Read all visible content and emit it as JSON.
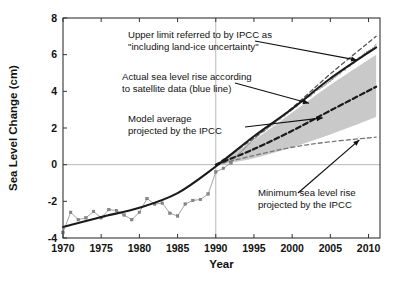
{
  "chart_data": {
    "type": "line",
    "title": "",
    "xlabel": "Year",
    "ylabel": "Sea Level Change (cm)",
    "xlim": [
      1970,
      2011.5
    ],
    "ylim": [
      -4,
      8
    ],
    "xticks": [
      1970,
      1975,
      1980,
      1985,
      1990,
      1995,
      2000,
      2005,
      2010
    ],
    "yticks": [
      -4,
      -2,
      0,
      2,
      4,
      6,
      8
    ],
    "xtick_labels": [
      "1970",
      "1975",
      "1980",
      "1985",
      "1990",
      "1995",
      "2000",
      "2005",
      "2010"
    ],
    "ytick_labels": [
      "-4",
      "-2",
      "0",
      "2",
      "4",
      "6",
      "8"
    ],
    "grid": false,
    "legend_position": "none",
    "reference_lines": [
      {
        "name": "zero-level-line",
        "axis": "y",
        "value": 0
      },
      {
        "name": "baseline-year-line",
        "axis": "x",
        "value": 1990
      }
    ],
    "series": [
      {
        "name": "Tide gauge observations",
        "style": "markers-thin-line",
        "color": "#8c8c8c",
        "x": [
          1970,
          1971,
          1972,
          1973,
          1974,
          1975,
          1976,
          1977,
          1978,
          1979,
          1980,
          1981,
          1982,
          1983,
          1984,
          1985,
          1986,
          1987,
          1988,
          1989,
          1990,
          1991,
          1992
        ],
        "values": [
          -3.7,
          -2.6,
          -3.0,
          -2.9,
          -2.55,
          -2.9,
          -2.45,
          -2.5,
          -2.75,
          -3.0,
          -2.6,
          -1.85,
          -2.15,
          -2.1,
          -2.65,
          -2.8,
          -2.15,
          -1.95,
          -1.9,
          -1.6,
          -0.4,
          -0.2,
          0.1
        ]
      },
      {
        "name": "Tide gauge smoothed trend",
        "style": "solid-thick",
        "color": "#1a1a1a",
        "x": [
          1970,
          1975,
          1980,
          1985,
          1990,
          1995,
          2000,
          2005,
          2011
        ],
        "values": [
          -3.4,
          -2.85,
          -2.35,
          -1.55,
          -0.1,
          1.55,
          3.05,
          4.7,
          6.4
        ]
      },
      {
        "name": "Actual sea level rise according to satellite data (blue line)",
        "style": "noisy-line",
        "color": "#7a7a7a",
        "x": [
          1992,
          1995,
          2000,
          2005,
          2011
        ],
        "values": [
          0.15,
          1.4,
          3.0,
          4.6,
          6.5
        ]
      },
      {
        "name": "Upper limit referred to by IPCC as \"including land-ice uncertainty\"",
        "style": "dashed",
        "color": "#555555",
        "x": [
          1990,
          1995,
          2000,
          2005,
          2011
        ],
        "values": [
          0,
          1.45,
          3.1,
          4.95,
          7.0
        ]
      },
      {
        "name": "Model average projected by the IPCC",
        "style": "dashed-thick",
        "color": "#1a1a1a",
        "x": [
          1990,
          1995,
          2000,
          2005,
          2011
        ],
        "values": [
          0,
          0.85,
          1.85,
          2.95,
          4.25
        ]
      },
      {
        "name": "Minimum sea level rise projected by the IPCC",
        "style": "dashed",
        "color": "#777777",
        "x": [
          1990,
          1995,
          2000,
          2005,
          2011
        ],
        "values": [
          0,
          0.5,
          0.95,
          1.25,
          1.5
        ]
      },
      {
        "name": "IPCC projection uncertainty band",
        "style": "shaded-band",
        "color": "#c9c9c9",
        "x": [
          1990,
          1995,
          2000,
          2005,
          2011
        ],
        "upper": [
          0.05,
          1.35,
          2.85,
          4.35,
          6.0
        ],
        "lower": [
          -0.05,
          0.35,
          0.95,
          1.65,
          2.6
        ]
      }
    ],
    "annotations": [
      {
        "name": "upper-limit-annotation",
        "lines": [
          "Upper limit referred to by IPCC as",
          "\"including land-ice uncertainty\""
        ],
        "arrow_to": {
          "x": 2008.5,
          "y": 5.7
        }
      },
      {
        "name": "satellite-annotation",
        "lines": [
          "Actual sea level rise according",
          "to satellite data (blue line)"
        ],
        "arrow_to": {
          "x": 2002.2,
          "y": 3.35
        }
      },
      {
        "name": "model-average-annotation",
        "lines": [
          "Model average",
          "projected by the IPCC"
        ],
        "arrow_to": {
          "x": 2004.0,
          "y": 2.55
        }
      },
      {
        "name": "minimum-rise-annotation",
        "lines": [
          "Minimum sea level rise",
          "projected by the IPCC"
        ],
        "arrow_to": {
          "x": 2008.8,
          "y": 1.35
        }
      }
    ]
  }
}
